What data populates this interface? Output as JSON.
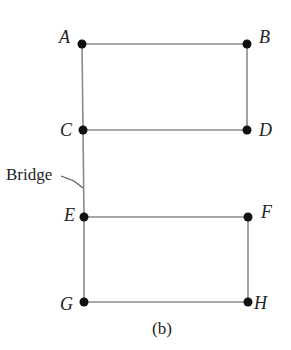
{
  "diagram": {
    "type": "graph",
    "caption": "(b)",
    "annotation": {
      "text": "Bridge",
      "target_edge": "C-E"
    },
    "nodes": [
      {
        "id": "A",
        "label": "A",
        "x": 82,
        "y": 44
      },
      {
        "id": "B",
        "label": "B",
        "x": 247,
        "y": 44
      },
      {
        "id": "C",
        "label": "C",
        "x": 83,
        "y": 130
      },
      {
        "id": "D",
        "label": "D",
        "x": 247,
        "y": 130
      },
      {
        "id": "E",
        "label": "E",
        "x": 84,
        "y": 217
      },
      {
        "id": "F",
        "label": "F",
        "x": 248,
        "y": 217
      },
      {
        "id": "G",
        "label": "G",
        "x": 84,
        "y": 302
      },
      {
        "id": "H",
        "label": "H",
        "x": 248,
        "y": 302
      }
    ],
    "edges": [
      [
        "A",
        "B"
      ],
      [
        "A",
        "C"
      ],
      [
        "B",
        "D"
      ],
      [
        "C",
        "D"
      ],
      [
        "C",
        "E"
      ],
      [
        "E",
        "F"
      ],
      [
        "E",
        "G"
      ],
      [
        "F",
        "H"
      ],
      [
        "G",
        "H"
      ]
    ],
    "colors": {
      "edge": "#8a8a8a",
      "node": "#111111",
      "text": "#222222"
    }
  }
}
